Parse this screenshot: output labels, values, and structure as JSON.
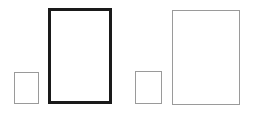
{
  "figure": {
    "background_color": "#ffffff",
    "width": 254,
    "height": 117
  },
  "chart_data": {
    "type": "diagram",
    "title": "",
    "xlabel": "",
    "ylabel": "",
    "shape_kind": "rectangle",
    "units": "pixels",
    "background": "#ffffff",
    "groups": [
      {
        "name": "left-pair",
        "label": "Left pair (bold large rectangle)",
        "shape_ids": [
          "small-rect-1",
          "large-rect-1"
        ]
      },
      {
        "name": "right-pair",
        "label": "Right pair (thin large rectangle)",
        "shape_ids": [
          "small-rect-2",
          "large-rect-2"
        ]
      }
    ],
    "shapes": [
      {
        "id": "small-rect-1",
        "name": "small-rectangle-left",
        "order": 1,
        "x": 14,
        "y": 72,
        "width": 25,
        "height": 32,
        "stroke_color": "#9a9a9a",
        "stroke_width": 1,
        "fill": "none",
        "aspect_ratio": 0.78
      },
      {
        "id": "large-rect-1",
        "name": "large-rectangle-bold",
        "order": 2,
        "x": 48,
        "y": 8,
        "width": 64,
        "height": 96,
        "stroke_color": "#1a1a1a",
        "stroke_width": 3,
        "fill": "none",
        "aspect_ratio": 0.67
      },
      {
        "id": "small-rect-2",
        "name": "small-rectangle-right",
        "order": 3,
        "x": 135,
        "y": 71,
        "width": 27,
        "height": 33,
        "stroke_color": "#9a9a9a",
        "stroke_width": 1,
        "fill": "none",
        "aspect_ratio": 0.82
      },
      {
        "id": "large-rect-2",
        "name": "large-rectangle-thin",
        "order": 4,
        "x": 172,
        "y": 10,
        "width": 68,
        "height": 95,
        "stroke_color": "#9a9a9a",
        "stroke_width": 1,
        "fill": "none",
        "aspect_ratio": 0.72
      }
    ],
    "legend": [],
    "annotations": []
  }
}
